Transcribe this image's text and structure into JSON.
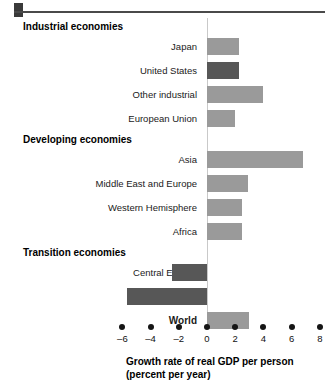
{
  "chart_data": {
    "type": "bar",
    "orientation": "horizontal",
    "title": "",
    "xlabel": "Growth rate of real GDP per person",
    "xlabel_line2": "(percent per year)",
    "ylabel": "",
    "xlim": [
      -7,
      8.6
    ],
    "xticks": [
      -6,
      -4,
      -2,
      0,
      2,
      4,
      6,
      8
    ],
    "xtick_labels": [
      "–6",
      "–4",
      "–2",
      "0",
      "2",
      "4",
      "6",
      "8"
    ],
    "grid": false,
    "legend": "none",
    "zero_line": 0,
    "groups": [
      {
        "header": "Industrial economies",
        "categories": [
          "Japan",
          "United States",
          "Other industrial",
          "European Union"
        ],
        "values": [
          2.3,
          2.3,
          4.0,
          2.0
        ],
        "shades": [
          "light",
          "dark",
          "light",
          "light"
        ]
      },
      {
        "header": "Developing economies",
        "categories": [
          "Asia",
          "Middle East and Europe",
          "Western Hemisphere",
          "Africa"
        ],
        "values": [
          6.8,
          2.9,
          2.5,
          2.5
        ],
        "shades": [
          "light",
          "light",
          "light",
          "light"
        ]
      },
      {
        "header": "Transition economies",
        "categories": [
          "Central Europe",
          "Russia"
        ],
        "values": [
          -2.5,
          -5.7
        ],
        "shades": [
          "dark",
          "dark"
        ]
      },
      {
        "header": "",
        "categories": [
          "World"
        ],
        "values": [
          3.0
        ],
        "shades": [
          "light"
        ],
        "bold_label": true
      }
    ],
    "categories": [
      "Japan",
      "United States",
      "Other industrial",
      "European Union",
      "Asia",
      "Middle East and Europe",
      "Western Hemisphere",
      "Africa",
      "Central Europe",
      "Russia",
      "World"
    ],
    "values": [
      2.3,
      2.3,
      4.0,
      2.0,
      6.8,
      2.9,
      2.5,
      2.5,
      -2.5,
      -5.7,
      3.0
    ],
    "colors": {
      "light_bar": "#9a9a9a",
      "dark_bar": "#575757",
      "zero_line": "#c9c9c9",
      "text": "#111111"
    }
  }
}
